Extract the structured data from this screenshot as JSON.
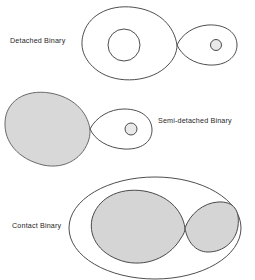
{
  "figure": {
    "title_clipped": "",
    "background_color": "#ffffff",
    "stroke_color": "#3a3a3a",
    "fill_color": "#d8d8d8",
    "star_fill_color": "#ffffff"
  },
  "systems": [
    {
      "id": "detached",
      "label": "Detached Binary",
      "label_x": 10,
      "label_y": 43,
      "primary": {
        "lobe_filled": "no",
        "star_fill": "#ffffff",
        "star_cx": 124,
        "star_cy": 45,
        "star_r": 16
      },
      "secondary": {
        "lobe_filled": "no",
        "star_fill": "#e8e8e8",
        "star_cx": 216,
        "star_cy": 45,
        "star_r": 5.5
      },
      "roche": {
        "lagrange_x": 177,
        "lagrange_y": 45,
        "left_outer_x": 83,
        "right_outer_x": 237,
        "left_half_height": 38,
        "right_half_height": 19
      }
    },
    {
      "id": "semi-detached",
      "label": "Semi-detached Binary",
      "label_x": 158,
      "label_y": 123,
      "primary": {
        "lobe_filled": "yes",
        "star_fill": "#d8d8d8",
        "star_cx": 0,
        "star_cy": 0,
        "star_r": 0
      },
      "secondary": {
        "lobe_filled": "no",
        "star_fill": "#e8e8e8",
        "star_cx": 131,
        "star_cy": 129,
        "star_r": 6
      },
      "roche": {
        "lagrange_x": 90,
        "lagrange_y": 129,
        "left_outer_x": 5,
        "right_outer_x": 152,
        "left_half_height": 38,
        "right_half_height": 20
      }
    },
    {
      "id": "contact",
      "label": "Contact Binary",
      "label_x": 12,
      "label_y": 228,
      "primary": {
        "lobe_filled": "yes",
        "star_fill": "#d8d8d8",
        "star_cx": 0,
        "star_cy": 0,
        "star_r": 0
      },
      "secondary": {
        "lobe_filled": "yes",
        "star_fill": "#d8d8d8",
        "star_cx": 0,
        "star_cy": 0,
        "star_r": 0
      },
      "roche": {
        "lagrange_x": 185,
        "lagrange_y": 228,
        "left_outer_x": 85,
        "right_outer_x": 237,
        "left_half_height": 38,
        "right_half_height": 23
      },
      "envelope": {
        "cx": 155,
        "cy": 228,
        "rx": 86,
        "ry": 51
      }
    }
  ]
}
